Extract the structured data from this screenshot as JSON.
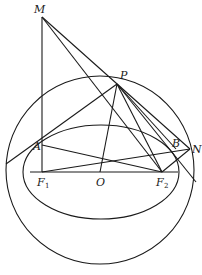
{
  "diagram": {
    "type": "geometry",
    "points": {
      "M": {
        "label": "M",
        "x": 42,
        "y": 17
      },
      "P": {
        "label": "P",
        "x": 117,
        "y": 84
      },
      "A": {
        "label": "A",
        "x": 42,
        "y": 145
      },
      "B": {
        "label": "B",
        "x": 176,
        "y": 149
      },
      "N": {
        "label": "N",
        "x": 190,
        "y": 149
      },
      "F1": {
        "label": "F",
        "sub": "1",
        "x": 42,
        "y": 172
      },
      "O": {
        "label": "O",
        "x": 100,
        "y": 172
      },
      "F2": {
        "label": "F",
        "sub": "2",
        "x": 162,
        "y": 172
      }
    },
    "circle": {
      "cx": 100,
      "cy": 170,
      "r": 94
    },
    "ellipse": {
      "cx": 101,
      "cy": 172,
      "rx": 78,
      "ry": 47
    },
    "stroke_color": "#1a1a1a"
  }
}
